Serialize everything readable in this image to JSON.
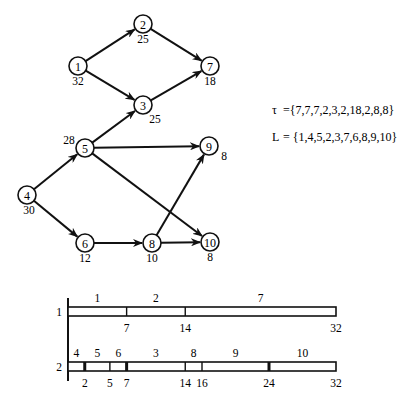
{
  "graph": {
    "nodes": [
      {
        "id": "1",
        "label": "1",
        "x": 78,
        "y": 66,
        "weight": "32",
        "wx": 78,
        "wy": 85
      },
      {
        "id": "2",
        "label": "2",
        "x": 143,
        "y": 24,
        "weight": "25",
        "wx": 143,
        "wy": 43
      },
      {
        "id": "3",
        "label": "3",
        "x": 143,
        "y": 105,
        "weight": "25",
        "wx": 155,
        "wy": 123
      },
      {
        "id": "4",
        "label": "4",
        "x": 27,
        "y": 195,
        "weight": "30",
        "wx": 29,
        "wy": 214
      },
      {
        "id": "5",
        "label": "5",
        "x": 85,
        "y": 148,
        "weight": "28",
        "wx": 69,
        "wy": 144
      },
      {
        "id": "6",
        "label": "6",
        "x": 85,
        "y": 243,
        "weight": "12",
        "wx": 85,
        "wy": 262
      },
      {
        "id": "7",
        "label": "7",
        "x": 210,
        "y": 66,
        "weight": "18",
        "wx": 210,
        "wy": 85
      },
      {
        "id": "8",
        "label": "8",
        "x": 152,
        "y": 243,
        "weight": "10",
        "wx": 152,
        "wy": 262
      },
      {
        "id": "9",
        "label": "9",
        "x": 209,
        "y": 146,
        "weight": "8",
        "wx": 224,
        "wy": 160
      },
      {
        "id": "10",
        "label": "10",
        "x": 210,
        "y": 242,
        "weight": "8",
        "wx": 210,
        "wy": 261
      }
    ],
    "edges": [
      {
        "from": "1",
        "to": "2"
      },
      {
        "from": "1",
        "to": "3"
      },
      {
        "from": "2",
        "to": "7"
      },
      {
        "from": "3",
        "to": "7"
      },
      {
        "from": "5",
        "to": "3"
      },
      {
        "from": "4",
        "to": "5"
      },
      {
        "from": "4",
        "to": "6"
      },
      {
        "from": "5",
        "to": "9"
      },
      {
        "from": "5",
        "to": "10"
      },
      {
        "from": "6",
        "to": "8"
      },
      {
        "from": "8",
        "to": "9"
      },
      {
        "from": "8",
        "to": "10"
      }
    ]
  },
  "formulas": {
    "tau": {
      "symbol": "τ",
      "text": "={7,7,7,2,3,2,18,2,8,8}"
    },
    "L": {
      "symbol": "L",
      "text": "= {1,4,5,2,3,7,6,8,9,10}"
    }
  },
  "gantt": {
    "scale": {
      "x0": 68,
      "x32": 336
    },
    "rows": [
      {
        "label": "1",
        "y": 307,
        "tasks": [
          {
            "name": "1",
            "start": 0,
            "end": 7
          },
          {
            "name": "2",
            "start": 7,
            "end": 14
          },
          {
            "name": "7",
            "start": 14,
            "end": 32
          }
        ],
        "ticks": [
          {
            "t": 7,
            "label": "7",
            "thick": false
          },
          {
            "t": 14,
            "label": "14",
            "thick": false
          },
          {
            "t": 32,
            "label": "32",
            "thick": false
          }
        ]
      },
      {
        "label": "2",
        "y": 362,
        "tasks": [
          {
            "name": "4",
            "start": 0,
            "end": 2
          },
          {
            "name": "5",
            "start": 2,
            "end": 5
          },
          {
            "name": "6",
            "start": 5,
            "end": 7
          },
          {
            "name": "3",
            "start": 7,
            "end": 14
          },
          {
            "name": "8",
            "start": 14,
            "end": 16
          },
          {
            "name": "9",
            "start": 16,
            "end": 24
          },
          {
            "name": "10",
            "start": 24,
            "end": 32
          }
        ],
        "ticks": [
          {
            "t": 2,
            "label": "2",
            "thick": true
          },
          {
            "t": 5,
            "label": "5",
            "thick": false
          },
          {
            "t": 7,
            "label": "7",
            "thick": true
          },
          {
            "t": 14,
            "label": "14",
            "thick": false
          },
          {
            "t": 16,
            "label": "16",
            "thick": false
          },
          {
            "t": 24,
            "label": "24",
            "thick": true
          },
          {
            "t": 32,
            "label": "32",
            "thick": false
          }
        ]
      }
    ]
  }
}
